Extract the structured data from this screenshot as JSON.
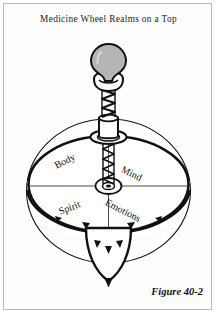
{
  "page": {
    "title": "Medicine Wheel Realms on a Top",
    "figure_caption": "Figure 40-2",
    "border_color": "#b9b9b9",
    "background_color": "#fefefe",
    "ink_color": "#111111"
  },
  "illustration": {
    "name": "spinning-top-medicine-wheel",
    "description": "Line drawing of a spinning top whose disk is divided into four labeled quadrants",
    "knob_fill": "#b5b5b5",
    "disk_fill": "#ffffff",
    "quadrants": [
      {
        "key": "body",
        "label": "Body",
        "position": "upper-left"
      },
      {
        "key": "mind",
        "label": "Mind",
        "position": "upper-right"
      },
      {
        "key": "spirit",
        "label": "Spirit",
        "position": "lower-left"
      },
      {
        "key": "emotions",
        "label": "Emotions",
        "position": "lower-right"
      }
    ],
    "parts": [
      "handle-knob",
      "collar",
      "spiral-shaft",
      "upper-hub",
      "wheel-disk",
      "center-washer",
      "cross-divider",
      "rim-band",
      "cone-tip"
    ]
  }
}
